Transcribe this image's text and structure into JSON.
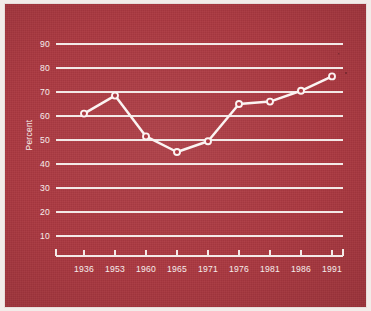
{
  "chart_data": {
    "type": "line",
    "title": "",
    "subtitle": "",
    "xlabel": "",
    "ylabel": "Percent",
    "x": [
      "1936",
      "1953",
      "1960",
      "1965",
      "1971",
      "1976",
      "1981",
      "1986",
      "1991"
    ],
    "categories": [
      "1936",
      "1953",
      "1960",
      "1965",
      "1971",
      "1976",
      "1981",
      "1986",
      "1991"
    ],
    "values": [
      61,
      68.5,
      51.5,
      45,
      49.5,
      65,
      66,
      70.5,
      76.5
    ],
    "series": [
      {
        "name": "Percent",
        "values": [
          61,
          68.5,
          51.5,
          45,
          49.5,
          65,
          66,
          70.5,
          76.5
        ]
      }
    ],
    "ylim": [
      0,
      95
    ],
    "ytick_labels": [
      "10",
      "20",
      "30",
      "40",
      "50",
      "60",
      "70",
      "80",
      "90"
    ],
    "ytick_values": [
      10,
      20,
      30,
      40,
      50,
      60,
      70,
      80,
      90
    ],
    "xtick_labels": [
      "1936",
      "1953",
      "1960",
      "1965",
      "1971",
      "1976",
      "1981",
      "1986",
      "1991"
    ],
    "grid": "horizontal",
    "legend": "none",
    "legend_position": "none",
    "markers": "open-circle",
    "annotations": []
  },
  "style": {
    "panel_background": "#ad3a42",
    "figure_background": "#f2ece9",
    "line_color": "#fbf4f2",
    "grid_color": "#f3e9e7",
    "text_color": "#f6eeec",
    "marker_fill": "#ad3a42"
  },
  "labels": {
    "y_axis_title": "Percent"
  }
}
